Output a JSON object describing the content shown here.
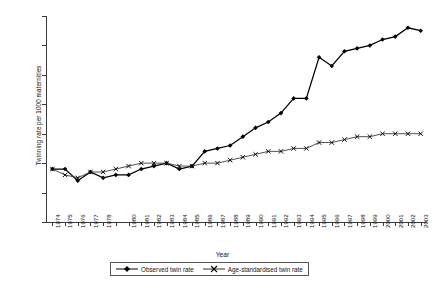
{
  "chart_data": {
    "type": "line",
    "title": "",
    "xlabel": "Year",
    "ylabel": "Twinning rate per 1000 maternities",
    "ylim": [
      8,
      15
    ],
    "yticks": [
      8,
      9,
      10,
      11,
      12,
      13,
      14,
      15
    ],
    "grid": false,
    "legend_position": "bottom",
    "x": [
      1974,
      1975,
      1976,
      1977,
      1978,
      1979,
      1980,
      1981,
      1982,
      1983,
      1984,
      1985,
      1986,
      1987,
      1988,
      1989,
      1990,
      1991,
      1992,
      1993,
      1994,
      1995,
      1996,
      1997,
      1998,
      1999,
      2000,
      2001,
      2002,
      2003
    ],
    "xtick_labels": [
      "1974",
      "1975",
      "1976",
      "1977",
      "1978",
      "",
      "1980",
      "1981",
      "1982",
      "1983",
      "1984",
      "1985",
      "1986",
      "1987",
      "1988",
      "1989",
      "1990",
      "1991",
      "1992",
      "1993",
      "1994",
      "1995",
      "1996",
      "1997",
      "1998",
      "1999",
      "2000",
      "2001",
      "2002",
      "2003"
    ],
    "series": [
      {
        "name": "Observed twin rate",
        "marker": "filled-diamond",
        "color": "#000000",
        "values": [
          9.8,
          9.8,
          9.4,
          9.7,
          9.5,
          9.6,
          9.6,
          9.8,
          9.9,
          10.0,
          9.8,
          9.9,
          10.4,
          10.5,
          10.6,
          10.9,
          11.2,
          11.4,
          11.7,
          12.2,
          12.2,
          13.6,
          13.3,
          13.8,
          13.9,
          14.0,
          14.2,
          14.3,
          14.6,
          14.5
        ]
      },
      {
        "name": "Age-standardised twin rate",
        "marker": "cross",
        "color": "#333333",
        "values": [
          9.8,
          9.6,
          9.5,
          9.7,
          9.7,
          9.8,
          9.9,
          10.0,
          10.0,
          10.0,
          9.9,
          9.9,
          10.0,
          10.0,
          10.1,
          10.2,
          10.3,
          10.4,
          10.4,
          10.5,
          10.5,
          10.7,
          10.7,
          10.8,
          10.9,
          10.9,
          11.0,
          11.0,
          11.0,
          11.0
        ]
      }
    ]
  },
  "legend": {
    "items": [
      {
        "label": "Observed twin rate"
      },
      {
        "label": "Age-standardised twin rate"
      }
    ]
  }
}
